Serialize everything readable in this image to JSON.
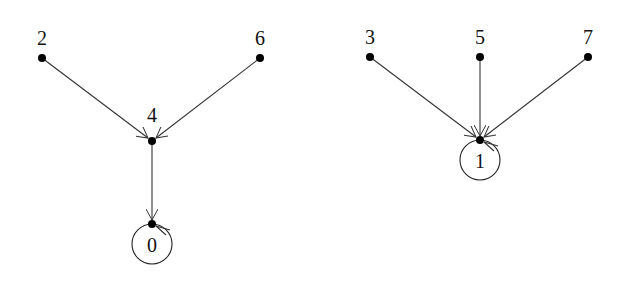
{
  "diagram": {
    "type": "functional-graph",
    "components": [
      {
        "name": "left-tree",
        "nodes": [
          {
            "id": "2",
            "label": "2",
            "x": 42,
            "y": 58,
            "lx": 42,
            "ly": 45
          },
          {
            "id": "6",
            "label": "6",
            "x": 260,
            "y": 58,
            "lx": 260,
            "ly": 45
          },
          {
            "id": "4",
            "label": "4",
            "x": 152,
            "y": 141,
            "lx": 152,
            "ly": 122
          },
          {
            "id": "0",
            "label": "0",
            "x": 152,
            "y": 224,
            "lx": 152,
            "ly": 252,
            "fixed_point": true
          }
        ],
        "edges": [
          {
            "from": "2",
            "to": "4"
          },
          {
            "from": "6",
            "to": "4"
          },
          {
            "from": "4",
            "to": "0"
          },
          {
            "from": "0",
            "to": "0",
            "self_loop": true
          }
        ]
      },
      {
        "name": "right-tree",
        "nodes": [
          {
            "id": "3",
            "label": "3",
            "x": 370,
            "y": 57,
            "lx": 370,
            "ly": 44
          },
          {
            "id": "5",
            "label": "5",
            "x": 480,
            "y": 57,
            "lx": 480,
            "ly": 44
          },
          {
            "id": "7",
            "label": "7",
            "x": 588,
            "y": 57,
            "lx": 588,
            "ly": 44
          },
          {
            "id": "1",
            "label": "1",
            "x": 480,
            "y": 140,
            "lx": 480,
            "ly": 168,
            "fixed_point": true
          }
        ],
        "edges": [
          {
            "from": "3",
            "to": "1"
          },
          {
            "from": "5",
            "to": "1"
          },
          {
            "from": "7",
            "to": "1"
          },
          {
            "from": "1",
            "to": "1",
            "self_loop": true
          }
        ]
      }
    ]
  },
  "labels": {
    "n0": "0",
    "n1": "1",
    "n2": "2",
    "n3": "3",
    "n4": "4",
    "n5": "5",
    "n6": "6",
    "n7": "7"
  }
}
